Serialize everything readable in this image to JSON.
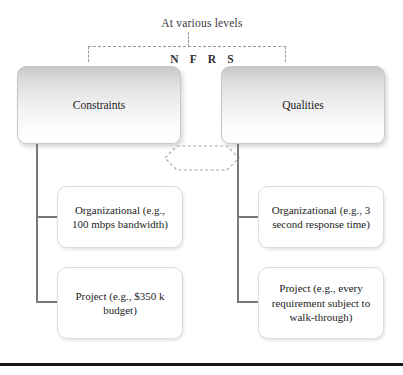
{
  "figure": {
    "background_color": "#ffffff",
    "bottom_rule_color": "#171717"
  },
  "annotations": {
    "top_caption": "At various levels",
    "level_codes": "N F R S"
  },
  "main_boxes": [
    {
      "label": "Constraints",
      "fill_top": "#c8c8c8",
      "fill_bottom": "#ffffff"
    },
    {
      "label": "Qualities",
      "fill_top": "#c8c8c8",
      "fill_bottom": "#ffffff"
    }
  ],
  "leaf_boxes": {
    "constraints": [
      {
        "label": "Organizational (e.g., 100 mbps bandwidth)"
      },
      {
        "label": "Project (e.g., $350 k budget)"
      }
    ],
    "qualities": [
      {
        "label": "Organizational (e.g., 3 second response time)"
      },
      {
        "label": "Project (e.g., every requirement subject to walk-through)"
      }
    ]
  },
  "connectors": {
    "bracket_style": "dashed",
    "bracket_color": "#9a9a9a",
    "tree_color": "#787878",
    "relation_arrow": "double-headed-dashed"
  }
}
